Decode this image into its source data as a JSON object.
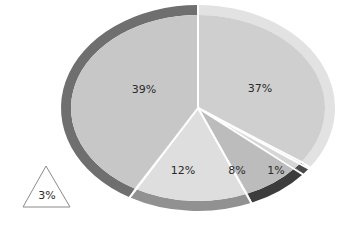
{
  "chart_data": {
    "type": "pie",
    "title": "",
    "note": "Labels shown sum to 97% inside the pie; a separate triangle callout shows 3%. Slice angles were measured from the image and are not strictly proportional to the labels.",
    "center": [
      198,
      108
    ],
    "radii": {
      "outer_rx": 137,
      "outer_ry": 103,
      "inner_rx": 127,
      "inner_ry": 93
    },
    "slices": [
      {
        "label": "37%",
        "value": 37,
        "start_deg": 0,
        "end_deg": 125,
        "fill": "#cfcfcf",
        "rim": "#e2e2e2",
        "label_pos": [
          260,
          89
        ]
      },
      {
        "label": "1%",
        "value": 1,
        "start_deg": 126,
        "end_deg": 130,
        "fill": "#d6d6d6",
        "rim": "#4a4a4a",
        "label_pos": [
          276,
          171
        ]
      },
      {
        "label": "8%",
        "value": 8,
        "start_deg": 130,
        "end_deg": 157,
        "fill": "#bcbcbc",
        "rim": "#3c3c3c",
        "label_pos": [
          237,
          171
        ]
      },
      {
        "label": "12%",
        "value": 12,
        "start_deg": 157,
        "end_deg": 210,
        "fill": "#dedede",
        "rim": "#919191",
        "label_pos": [
          183,
          171
        ]
      },
      {
        "label": "39%",
        "value": 39,
        "start_deg": 210,
        "end_deg": 360,
        "fill": "#c7c7c7",
        "rim": "#6f6f6f",
        "label_pos": [
          144,
          90
        ]
      }
    ],
    "callout": {
      "label": "3%",
      "value": 3,
      "shape": "triangle",
      "label_pos": [
        47,
        196
      ]
    },
    "legend": null
  }
}
